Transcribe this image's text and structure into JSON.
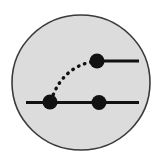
{
  "figure": {
    "canvas": {
      "width": 163,
      "height": 165,
      "background": "#ffffff"
    },
    "circle": {
      "label": "shaded-blob",
      "cx": 81,
      "cy": 82.5,
      "rx": 69,
      "ry": 67.5,
      "fill": "#dcdcdc",
      "stroke": "#3a3a3a",
      "stroke_width": 1.6
    },
    "lines": [
      {
        "label": "upper-fermion-line",
        "x1": 97,
        "y1": 61,
        "x2": 139,
        "y2": 61,
        "stroke": "#111111",
        "stroke_width": 3
      },
      {
        "label": "lower-fermion-line",
        "x1": 26,
        "y1": 102.5,
        "x2": 139,
        "y2": 102.5,
        "stroke": "#111111",
        "stroke_width": 3
      }
    ],
    "curve": {
      "label": "dotted-propagator-arc",
      "path": "M 51 101 Q 62 66 96 61",
      "stroke": "#111111",
      "stroke_width": 3.4,
      "dash": "0.5 6",
      "linecap": "round"
    },
    "vertices": [
      {
        "label": "vertex-lower-left",
        "cx": 50,
        "cy": 102,
        "r": 7.5,
        "fill": "#111111"
      },
      {
        "label": "vertex-lower-right",
        "cx": 99,
        "cy": 102.5,
        "r": 7.5,
        "fill": "#111111"
      },
      {
        "label": "vertex-upper",
        "cx": 97,
        "cy": 61,
        "r": 7.5,
        "fill": "#111111"
      }
    ]
  }
}
